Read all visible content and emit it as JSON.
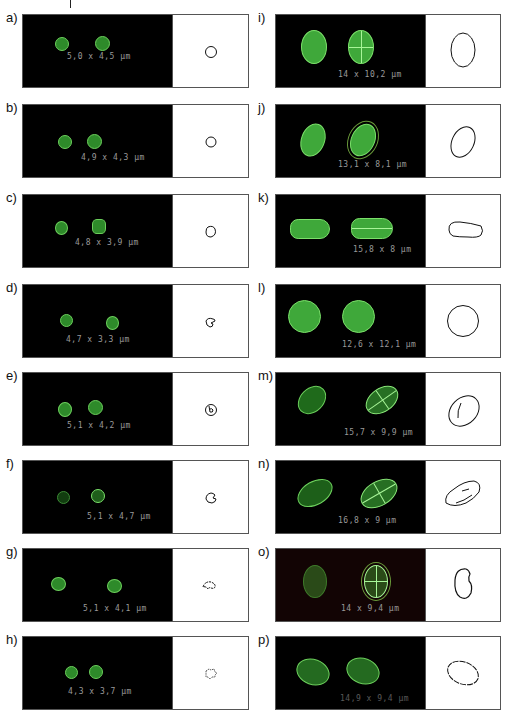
{
  "figure": {
    "panels": [
      {
        "label": "a)",
        "measurement": "5,0 x 4,5 µm",
        "length_um": 5.0,
        "width_um": 4.5
      },
      {
        "label": "b)",
        "measurement": "4,9 x 4,3 µm",
        "length_um": 4.9,
        "width_um": 4.3
      },
      {
        "label": "c)",
        "measurement": "4,8 x 3,9 µm",
        "length_um": 4.8,
        "width_um": 3.9
      },
      {
        "label": "d)",
        "measurement": "4,7 x 3,3 µm",
        "length_um": 4.7,
        "width_um": 3.3
      },
      {
        "label": "e)",
        "measurement": "5,1 x 4,2 µm",
        "length_um": 5.1,
        "width_um": 4.2
      },
      {
        "label": "f)",
        "measurement": "5,1 x 4,7 µm",
        "length_um": 5.1,
        "width_um": 4.7
      },
      {
        "label": "g)",
        "measurement": "5,1 x 4,1 µm",
        "length_um": 5.1,
        "width_um": 4.1
      },
      {
        "label": "h)",
        "measurement": "4,3 x 3,7 µm",
        "length_um": 4.3,
        "width_um": 3.7
      },
      {
        "label": "i)",
        "measurement": "14 x 10,2 µm",
        "length_um": 14.0,
        "width_um": 10.2
      },
      {
        "label": "j)",
        "measurement": "13,1 x 8,1 µm",
        "length_um": 13.1,
        "width_um": 8.1
      },
      {
        "label": "k)",
        "measurement": "15,8 x 8 µm",
        "length_um": 15.8,
        "width_um": 8.0
      },
      {
        "label": "l)",
        "measurement": "12,6 x 12,1 µm",
        "length_um": 12.6,
        "width_um": 12.1
      },
      {
        "label": "m)",
        "measurement": "15,7 x 9,9 µm",
        "length_um": 15.7,
        "width_um": 9.9
      },
      {
        "label": "n)",
        "measurement": "16,8 x 9 µm",
        "length_um": 16.8,
        "width_um": 9.0
      },
      {
        "label": "o)",
        "measurement": "14 x 9,4 µm",
        "length_um": 14.0,
        "width_um": 9.4
      },
      {
        "label": "p)",
        "measurement": "14,9 x 9,4 µm",
        "length_um": 14.9,
        "width_um": 9.4
      }
    ]
  },
  "colors": {
    "cell_fill": "#3fa83a",
    "cell_edge": "#7be06a",
    "micro_bg": "#000000",
    "micro_bg_o": "#120404",
    "outline_stroke": "#111111",
    "measure_text": "#9a9a9a"
  }
}
